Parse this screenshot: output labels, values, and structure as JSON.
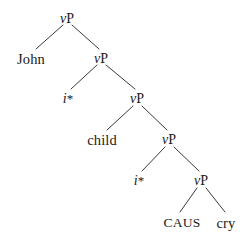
{
  "figure": {
    "type": "syntax-tree",
    "background_color": "#ffffff",
    "line_color": "#3a3a3a",
    "text_color": "#1a1a1a",
    "width": 251,
    "height": 242
  },
  "labels": {
    "vp": "vP",
    "v_italic": "v",
    "p_roman": "P",
    "i_italic": "i",
    "asterisk": "*",
    "john": "John",
    "child": "child",
    "caus": "CAUS",
    "cry": "cry"
  },
  "tree": {
    "root": {
      "name": "vP-level-1",
      "label": "vP",
      "x": 67,
      "y": 20,
      "children": [
        "John",
        "vP-level-2"
      ]
    },
    "nodes": [
      {
        "name": "vP-level-1",
        "label": "vP",
        "kind": "category",
        "x": 67,
        "y": 20,
        "depth": 1
      },
      {
        "name": "John",
        "label": "John",
        "kind": "terminal",
        "x": 31,
        "y": 60,
        "depth": 2
      },
      {
        "name": "vP-level-2",
        "label": "vP",
        "kind": "category",
        "x": 101,
        "y": 60,
        "depth": 2
      },
      {
        "name": "i-star-1",
        "label": "i*",
        "kind": "terminal",
        "x": 68,
        "y": 100,
        "depth": 3
      },
      {
        "name": "vP-level-3",
        "label": "vP",
        "kind": "category",
        "x": 137,
        "y": 100,
        "depth": 3
      },
      {
        "name": "child",
        "label": "child",
        "kind": "terminal",
        "x": 102,
        "y": 141,
        "depth": 4
      },
      {
        "name": "vP-level-4",
        "label": "vP",
        "kind": "category",
        "x": 169,
        "y": 141,
        "depth": 4
      },
      {
        "name": "i-star-2",
        "label": "i*",
        "kind": "terminal",
        "x": 139,
        "y": 182,
        "depth": 5
      },
      {
        "name": "vP-level-5",
        "label": "vP",
        "kind": "category",
        "x": 201,
        "y": 182,
        "depth": 5
      },
      {
        "name": "CAUS",
        "label": "CAUS",
        "kind": "terminal",
        "x": 182,
        "y": 224,
        "depth": 6
      },
      {
        "name": "cry",
        "label": "cry",
        "kind": "terminal",
        "x": 226,
        "y": 224,
        "depth": 6
      }
    ],
    "branches": [
      {
        "name": "branch-vp1-john",
        "x1": 63,
        "y1": 25,
        "x2": 36,
        "y2": 49
      },
      {
        "name": "branch-vp1-vp2",
        "x1": 72,
        "y1": 25,
        "x2": 99,
        "y2": 49
      },
      {
        "name": "branch-vp2-istar1",
        "x1": 97,
        "y1": 65,
        "x2": 71,
        "y2": 89
      },
      {
        "name": "branch-vp2-vp3",
        "x1": 106,
        "y1": 65,
        "x2": 135,
        "y2": 89
      },
      {
        "name": "branch-vp3-child",
        "x1": 133,
        "y1": 106,
        "x2": 107,
        "y2": 130
      },
      {
        "name": "branch-vp3-vp4",
        "x1": 142,
        "y1": 106,
        "x2": 167,
        "y2": 130
      },
      {
        "name": "branch-vp4-istar2",
        "x1": 165,
        "y1": 147,
        "x2": 142,
        "y2": 171
      },
      {
        "name": "branch-vp4-vp5",
        "x1": 174,
        "y1": 147,
        "x2": 199,
        "y2": 171
      },
      {
        "name": "branch-vp5-caus",
        "x1": 197,
        "y1": 188,
        "x2": 180,
        "y2": 212
      },
      {
        "name": "branch-vp5-cry",
        "x1": 206,
        "y1": 188,
        "x2": 225,
        "y2": 212
      }
    ]
  }
}
